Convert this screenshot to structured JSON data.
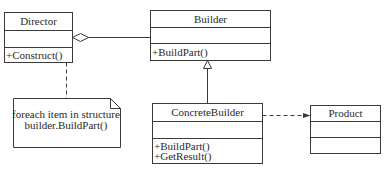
{
  "classes": {
    "director": {
      "name": "Director",
      "attributes": [],
      "operations": [
        "+Construct()"
      ]
    },
    "builder": {
      "name": "Builder",
      "attributes": [],
      "operations": [
        "+BuildPart()"
      ]
    },
    "concrete_builder": {
      "name": "ConcreteBuilder",
      "attributes": [],
      "operations": [
        "+BuildPart()",
        "+GetResult()"
      ]
    },
    "product": {
      "name": "Product",
      "attributes": [],
      "operations": []
    }
  },
  "note": {
    "lines": [
      "foreach item in structure",
      "builder.BuildPart()"
    ]
  },
  "relations": [
    {
      "type": "aggregation",
      "from": "Director",
      "to": "Builder"
    },
    {
      "type": "generalization",
      "from": "ConcreteBuilder",
      "to": "Builder"
    },
    {
      "type": "dependency",
      "from": "ConcreteBuilder",
      "to": "Product"
    },
    {
      "type": "note-anchor",
      "from": "note",
      "to": "Director"
    }
  ]
}
